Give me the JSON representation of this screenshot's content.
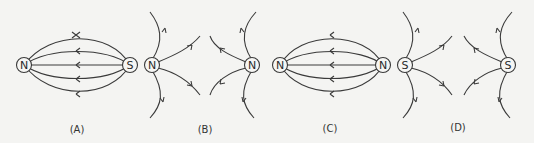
{
  "figure": {
    "panels": [
      {
        "id": "A",
        "caption": "(A)",
        "arrangement": "attracting",
        "left_pole": "N",
        "right_pole": "S",
        "field_direction": "right-to-left (S to N)",
        "line_count": 5
      },
      {
        "id": "B",
        "caption": "(B)",
        "arrangement": "repelling",
        "left_pole": "N",
        "right_pole": "N",
        "field_direction": "outward from both poles",
        "lines_per_pole": 4
      },
      {
        "id": "C",
        "caption": "(C)",
        "arrangement": "attracting",
        "left_pole": "N",
        "right_pole": "N",
        "field_direction": "right-to-left",
        "line_count": 5
      },
      {
        "id": "D",
        "caption": "(D)",
        "arrangement": "repelling",
        "left_pole": "S",
        "right_pole": "S",
        "field_direction": "outward from both poles",
        "lines_per_pole": 4
      }
    ],
    "colors": {
      "background": "#f4f4f2",
      "stroke": "#3a3a3a"
    }
  }
}
